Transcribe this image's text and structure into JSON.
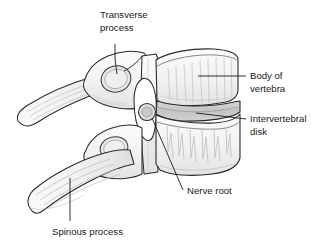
{
  "figure": {
    "type": "anatomical-illustration",
    "background_color": "#ffffff",
    "line_color": "#1a1a1a",
    "bone_fill": "#f2f2f0",
    "bone_shade": "#d8d8d6",
    "disk_fill": "#c9c9c7",
    "text_color": "#1a1a1a"
  },
  "labels": {
    "transverse_process": {
      "line1": "Transverse",
      "line2": "process"
    },
    "body_of_vertebra": {
      "line1": "Body of",
      "line2": "vertebra"
    },
    "intervertebral_disk": {
      "line1": "Intervertebral",
      "line2": "disk"
    },
    "nerve_root": {
      "line1": "Nerve root"
    },
    "spinous_process": {
      "line1": "Spinous process"
    }
  }
}
